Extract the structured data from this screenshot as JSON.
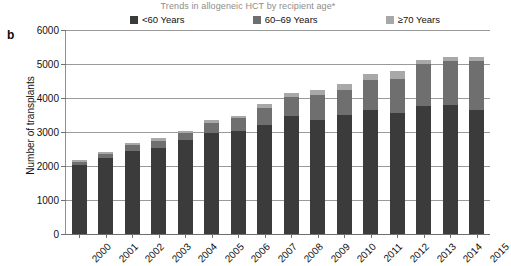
{
  "figure": {
    "panel_letter": "b",
    "title": "Trends in allogeneic HCT by recipient age*"
  },
  "legend": {
    "items": [
      {
        "label": "<60 Years",
        "color": "#3b3b3b"
      },
      {
        "label": "60–69 Years",
        "color": "#6f6f6f"
      },
      {
        "label": "≥70 Years",
        "color": "#a8a8a8"
      }
    ]
  },
  "axes": {
    "y_title": "Number of transplants",
    "y_ticks": [
      "0",
      "1000",
      "2000",
      "3000",
      "4000",
      "5000",
      "6000"
    ]
  },
  "chart_data": {
    "type": "bar",
    "title": "Trends in allogeneic HCT by recipient age*",
    "xlabel": "",
    "ylabel": "Number of transplants",
    "ylim": [
      0,
      6000
    ],
    "grid": true,
    "stacked": true,
    "legend_position": "top",
    "categories": [
      "2000",
      "2001",
      "2002",
      "2003",
      "2004",
      "2005",
      "2006",
      "2007",
      "2008",
      "2009",
      "2010",
      "2011",
      "2012",
      "2013",
      "2014",
      "2015"
    ],
    "series": [
      {
        "name": "<60 Years",
        "color": "#3b3b3b",
        "values": [
          2030,
          2240,
          2440,
          2520,
          2770,
          2970,
          3020,
          3220,
          3470,
          3360,
          3490,
          3640,
          3550,
          3760,
          3780,
          3660
        ]
      },
      {
        "name": "60–69 Years",
        "color": "#6f6f6f",
        "values": [
          100,
          120,
          190,
          230,
          210,
          300,
          380,
          500,
          560,
          720,
          740,
          900,
          1000,
          1250,
          1300,
          1430
        ]
      },
      {
        "name": "≥70 Years",
        "color": "#a8a8a8",
        "values": [
          40,
          40,
          50,
          70,
          60,
          70,
          70,
          100,
          110,
          160,
          190,
          170,
          240,
          120,
          120,
          120
        ]
      }
    ],
    "totals": [
      2170,
      2400,
      2680,
      2820,
      3040,
      3340,
      3470,
      3820,
      4140,
      4240,
      4420,
      4710,
      4790,
      5130,
      5200,
      5210
    ]
  }
}
